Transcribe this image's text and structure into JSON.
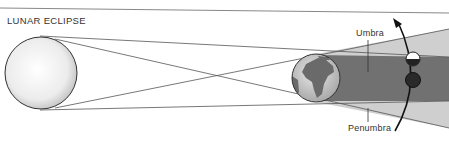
{
  "diagram": {
    "title": "LUNAR ECLIPSE",
    "labels": {
      "umbra": "Umbra",
      "penumbra": "Penumbra"
    },
    "objects": [
      "sun",
      "earth",
      "moon-partial",
      "moon-eclipsed"
    ],
    "colors": {
      "penumbra": "#c9c9c9",
      "umbra": "#6e6e6e",
      "lines": "#555555",
      "moon_dark": "#2a2a2a"
    }
  }
}
